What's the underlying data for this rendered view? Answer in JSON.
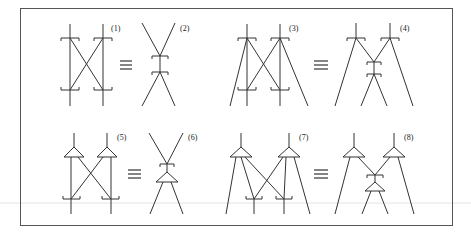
{
  "figure": {
    "type": "equivalence-diagrams",
    "labels": [
      "(1)",
      "(2)",
      "(3)",
      "(4)",
      "(5)",
      "(6)",
      "(7)",
      "(8)"
    ],
    "equivalence_symbol": "≡",
    "pairs": [
      {
        "left": "(1)",
        "right": "(2)",
        "row": 1
      },
      {
        "left": "(3)",
        "right": "(4)",
        "row": 1
      },
      {
        "left": "(5)",
        "right": "(6)",
        "row": 2
      },
      {
        "left": "(7)",
        "right": "(8)",
        "row": 2
      }
    ],
    "colors": {
      "stroke": "#333333",
      "frame": "#555555",
      "background": "#ffffff"
    }
  }
}
